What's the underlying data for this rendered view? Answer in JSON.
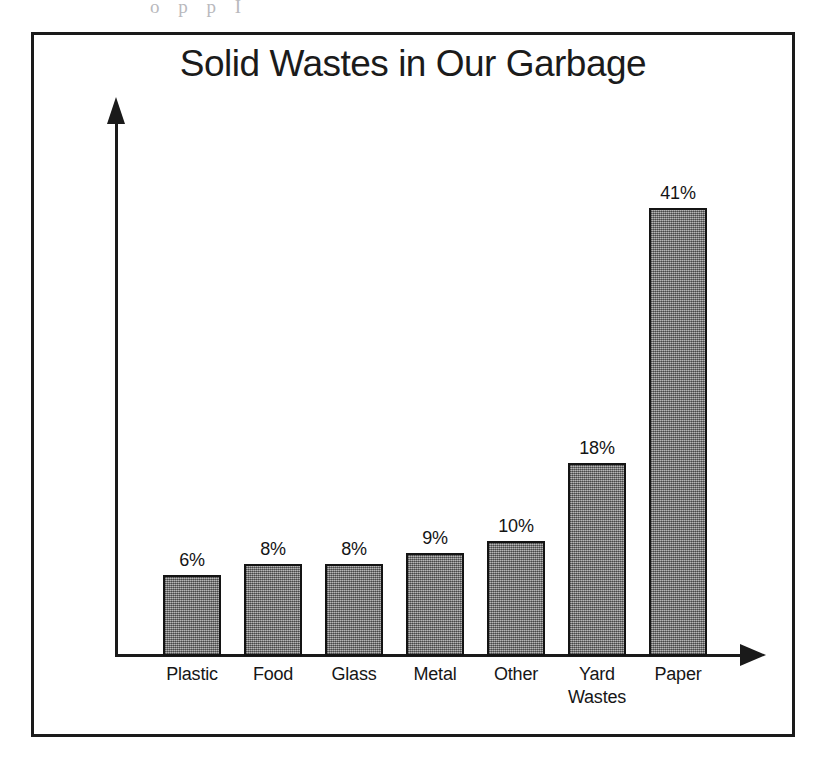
{
  "page": {
    "scan_artifact_text": "o p p I",
    "background_color": "#ffffff"
  },
  "figure": {
    "border_color": "#1a1a1a",
    "title": "Solid Wastes in Our Garbage"
  },
  "chart_data": {
    "type": "bar",
    "title": "Solid Wastes in Our Garbage",
    "xlabel": "",
    "ylabel": "",
    "categories": [
      "Plastic",
      "Food",
      "Glass",
      "Metal",
      "Other",
      "Yard Wastes",
      "Paper"
    ],
    "values": [
      6,
      8,
      8,
      9,
      10,
      18,
      41
    ],
    "value_labels": [
      "6%",
      "8%",
      "8%",
      "9%",
      "10%",
      "18%",
      "41%"
    ],
    "unit": "%",
    "ylim": [
      0,
      41
    ],
    "grid": false,
    "legend": null,
    "axis_style": "arrow-headed axes, no tick marks, no y-axis scale",
    "bar_fill_color": "#8b8b8b",
    "bar_outline_color": "#141414",
    "bars": [
      {
        "category": "Plastic",
        "label_lines": [
          "Plastic"
        ],
        "value": 6,
        "value_label": "6%",
        "left": 160,
        "height_px": 81
      },
      {
        "category": "Food",
        "label_lines": [
          "Food"
        ],
        "value": 8,
        "value_label": "8%",
        "left": 241,
        "height_px": 92
      },
      {
        "category": "Glass",
        "label_lines": [
          "Glass"
        ],
        "value": 8,
        "value_label": "8%",
        "left": 322,
        "height_px": 92
      },
      {
        "category": "Metal",
        "label_lines": [
          "Metal"
        ],
        "value": 9,
        "value_label": "9%",
        "left": 403,
        "height_px": 103
      },
      {
        "category": "Other",
        "label_lines": [
          "Other"
        ],
        "value": 10,
        "value_label": "10%",
        "left": 484,
        "height_px": 115
      },
      {
        "category": "Yard Wastes",
        "label_lines": [
          "Yard",
          "Wastes"
        ],
        "value": 18,
        "value_label": "18%",
        "left": 565,
        "height_px": 193
      },
      {
        "category": "Paper",
        "label_lines": [
          "Paper"
        ],
        "value": 41,
        "value_label": "41%",
        "left": 646,
        "height_px": 448
      }
    ]
  }
}
